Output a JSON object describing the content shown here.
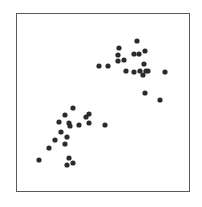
{
  "chart_data": {
    "type": "scatter",
    "title": "",
    "xlabel": "",
    "ylabel": "",
    "grid": false,
    "legend": null,
    "axes_ticks": "none",
    "frame_px": {
      "left": 16,
      "top": 13,
      "right": 189,
      "bottom": 191
    },
    "point_color": "#2b2b2b",
    "point_radius_px": 2.6,
    "series": [
      {
        "name": "upper-cluster",
        "points_px": [
          [
            99,
            66
          ],
          [
            108,
            66
          ],
          [
            119,
            48
          ],
          [
            118,
            55
          ],
          [
            118,
            61
          ],
          [
            124,
            60
          ],
          [
            126,
            71
          ],
          [
            137,
            41
          ],
          [
            134,
            54
          ],
          [
            139,
            54
          ],
          [
            145,
            51
          ],
          [
            144,
            64
          ],
          [
            134,
            72
          ],
          [
            140,
            71
          ],
          [
            143,
            75
          ],
          [
            146,
            71
          ],
          [
            148,
            71
          ],
          [
            165,
            72
          ],
          [
            145,
            93
          ],
          [
            160,
            100
          ]
        ]
      },
      {
        "name": "lower-cluster",
        "points_px": [
          [
            73,
            108
          ],
          [
            65,
            115
          ],
          [
            89,
            114
          ],
          [
            86,
            117
          ],
          [
            59,
            122
          ],
          [
            69,
            123
          ],
          [
            70,
            126
          ],
          [
            79,
            125
          ],
          [
            89,
            123
          ],
          [
            105,
            125
          ],
          [
            61,
            132
          ],
          [
            55,
            140
          ],
          [
            67,
            137
          ],
          [
            65,
            144
          ],
          [
            49,
            148
          ],
          [
            39,
            160
          ],
          [
            69,
            158
          ],
          [
            73,
            163
          ],
          [
            67,
            165
          ]
        ]
      }
    ]
  }
}
